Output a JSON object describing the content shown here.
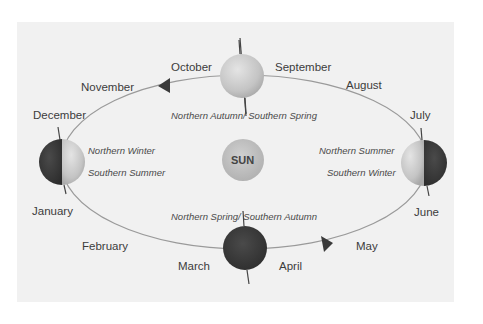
{
  "diagram": {
    "center_label": "SUN",
    "months": {
      "january": "January",
      "february": "February",
      "march": "March",
      "april": "April",
      "may": "May",
      "june": "June",
      "july": "July",
      "august": "August",
      "september": "September",
      "october": "October",
      "november": "November",
      "december": "December"
    },
    "seasons": {
      "top": "Northern Autumn/ Southern Spring",
      "bottom": "Northern Spring/ Southern Autumn",
      "left_north": "Northern Winter",
      "left_south": "Southern Summer",
      "right_north": "Northern Summer",
      "right_south": "Southern Winter"
    },
    "colors": {
      "panel": "#f1f1f1",
      "orbit": "#9a9a9a",
      "globe_light": "#c8c8c8",
      "globe_dark": "#3a3a3a",
      "sun": "#bdbdbd",
      "arrow": "#3a3a3a",
      "axis": "#444444"
    },
    "icons": {
      "direction_arrows": [
        "arrow-left-icon",
        "arrow-right-icon"
      ],
      "globes": [
        "earth-september-icon",
        "earth-march-icon",
        "earth-december-icon",
        "earth-june-icon"
      ],
      "sun": "sun-icon"
    }
  }
}
